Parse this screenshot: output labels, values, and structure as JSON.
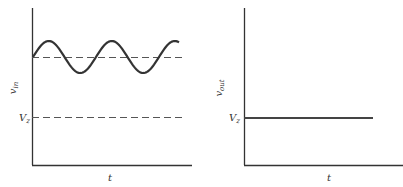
{
  "left_plot": {
    "y_label": "v",
    "y_label_sub": "in",
    "x_label": "t",
    "reference_label": "V",
    "reference_label_sub": "z",
    "description": "Sinusoidal input above Zener voltage; dashed DC level and dashed Vz level"
  },
  "right_plot": {
    "y_label": "v",
    "y_label_sub": "out",
    "x_label": "t",
    "reference_label": "V",
    "reference_label_sub": "z",
    "description": "Constant output equal to Vz"
  },
  "colors": {
    "ink": "#333333"
  }
}
